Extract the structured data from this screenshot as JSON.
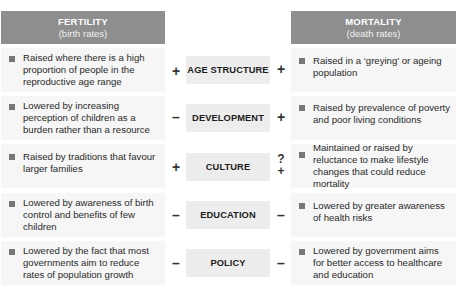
{
  "headers": {
    "left": {
      "title": "FERTILITY",
      "subtitle": "(birth rates)"
    },
    "right": {
      "title": "MORTALITY",
      "subtitle": "(death rates)"
    }
  },
  "rows": [
    {
      "factor": "AGE STRUCTURE",
      "fertility_text": "Raised where there is a high proportion of people in the reproductive age range",
      "fertility_sign": "+",
      "mortality_sign": "+",
      "mortality_text": "Raised in a ‘greying’ or ageing population"
    },
    {
      "factor": "DEVELOPMENT",
      "fertility_text": "Lowered by increasing perception of children as a burden rather than a resource",
      "fertility_sign": "–",
      "mortality_sign": "+",
      "mortality_text": "Raised by prevalence of poverty and poor living conditions"
    },
    {
      "factor": "CULTURE",
      "fertility_text": "Raised by traditions that favour larger families",
      "fertility_sign": "+",
      "mortality_sign_top": "?",
      "mortality_sign": "+",
      "mortality_text": "Maintained or raised by reluctance to make lifestyle changes that could reduce mortality"
    },
    {
      "factor": "EDUCATION",
      "fertility_text": "Lowered by awareness of birth control and benefits of few children",
      "fertility_sign": "–",
      "mortality_sign": "–",
      "mortality_text": "Lowered by greater awareness of health risks"
    },
    {
      "factor": "POLICY",
      "fertility_text": "Lowered by the fact that most governments aim to reduce rates of population growth",
      "fertility_sign": "–",
      "mortality_sign": "–",
      "mortality_text": "Lowered by government aims for better access to healthcare and education"
    }
  ],
  "colors": {
    "header_bg": "#8e8e8e",
    "cell_bg": "#f6f6f6",
    "factor_bg": "#ededed",
    "bullet": "#777777"
  }
}
